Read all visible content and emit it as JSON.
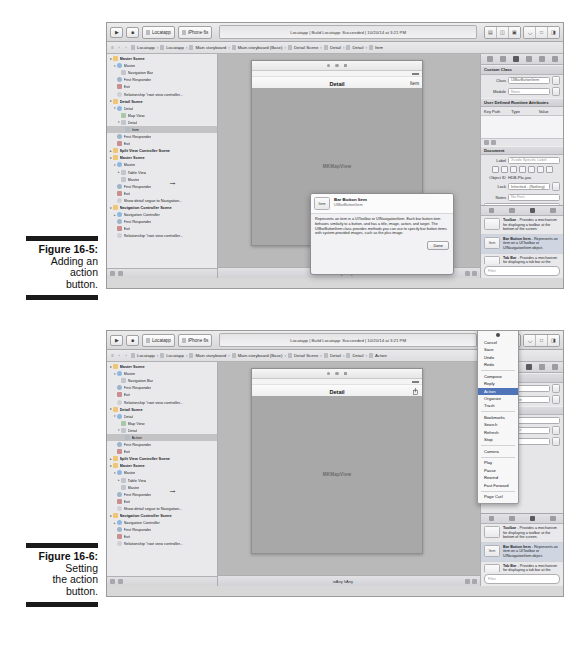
{
  "figures": [
    {
      "id": "fig-16-5",
      "number": "Figure 16-5:",
      "lines": [
        "Adding an",
        "action",
        "button."
      ]
    },
    {
      "id": "fig-16-6",
      "number": "Figure 16-6:",
      "lines": [
        "Setting",
        "the action",
        "button."
      ]
    }
  ],
  "xcode": {
    "toolbar": {
      "run_label": "▶",
      "stop_label": "■",
      "scheme_label": "Locatapp",
      "destination_label": "iPhone 6s",
      "status_text": "Locatapp | Build Locatapp: Succeeded | 10/20/14 at 3:21 PM",
      "editor_segments": [
        "▤",
        "▥",
        "▧"
      ],
      "view_segments": [
        "◧",
        "□",
        "◨"
      ]
    },
    "jumpbar": {
      "back_label": "‹",
      "forward_label": "›",
      "crumbs_5": [
        "Locatapp",
        "Locatapp",
        "Main.storyboard",
        "Main.storyboard (Base)",
        "Detail Scene",
        "Detail",
        "Detail",
        "Item"
      ],
      "crumbs_6": [
        "Locatapp",
        "Locatapp",
        "Main.storyboard",
        "Main.storyboard (Base)",
        "Detail Scene",
        "Detail",
        "Detail",
        "Action"
      ]
    },
    "canvas_title": "Main.storyboard",
    "outline_5": [
      {
        "label": "Master Scene",
        "depth": 0,
        "kind": "scene",
        "twisty": "▾",
        "selected": false
      },
      {
        "label": "Master",
        "depth": 1,
        "kind": "vc",
        "twisty": "▾",
        "selected": false
      },
      {
        "label": "Navigation Bar",
        "depth": 2,
        "kind": "bar",
        "twisty": "",
        "selected": false
      },
      {
        "label": "First Responder",
        "depth": 1,
        "kind": "resp",
        "twisty": "",
        "selected": false
      },
      {
        "label": "Exit",
        "depth": 1,
        "kind": "exit",
        "twisty": "",
        "selected": false
      },
      {
        "label": "Relationship \"root view controller...",
        "depth": 1,
        "kind": "rel",
        "twisty": "",
        "selected": false
      },
      {
        "label": "Detail Scene",
        "depth": 0,
        "kind": "scene",
        "twisty": "▾",
        "selected": false
      },
      {
        "label": "Detail",
        "depth": 1,
        "kind": "vc",
        "twisty": "▾",
        "selected": false
      },
      {
        "label": "Map View",
        "depth": 2,
        "kind": "map",
        "twisty": "",
        "selected": false
      },
      {
        "label": "Detail",
        "depth": 2,
        "kind": "bar",
        "twisty": "▾",
        "selected": false
      },
      {
        "label": "Item",
        "depth": 3,
        "kind": "item",
        "twisty": "",
        "selected": true
      },
      {
        "label": "First Responder",
        "depth": 1,
        "kind": "resp",
        "twisty": "",
        "selected": false
      },
      {
        "label": "Exit",
        "depth": 1,
        "kind": "exit",
        "twisty": "",
        "selected": false
      },
      {
        "label": "Split View Controller Scene",
        "depth": 0,
        "kind": "scene",
        "twisty": "▸",
        "selected": false
      },
      {
        "label": "Master Scene",
        "depth": 0,
        "kind": "scene",
        "twisty": "▾",
        "selected": false
      },
      {
        "label": "Master",
        "depth": 1,
        "kind": "vc",
        "twisty": "▾",
        "selected": false
      },
      {
        "label": "Table View",
        "depth": 2,
        "kind": "table",
        "twisty": "▸",
        "selected": false
      },
      {
        "label": "Master",
        "depth": 2,
        "kind": "bar",
        "twisty": "",
        "selected": false
      },
      {
        "label": "First Responder",
        "depth": 1,
        "kind": "resp",
        "twisty": "",
        "selected": false
      },
      {
        "label": "Exit",
        "depth": 1,
        "kind": "exit",
        "twisty": "",
        "selected": false
      },
      {
        "label": "Show detail segue to Navigation...",
        "depth": 1,
        "kind": "rel",
        "twisty": "",
        "selected": false
      },
      {
        "label": "Navigation Controller Scene",
        "depth": 0,
        "kind": "scene",
        "twisty": "▾",
        "selected": false
      },
      {
        "label": "Navigation Controller",
        "depth": 1,
        "kind": "vc",
        "twisty": "▸",
        "selected": false
      },
      {
        "label": "First Responder",
        "depth": 1,
        "kind": "resp",
        "twisty": "",
        "selected": false
      },
      {
        "label": "Exit",
        "depth": 1,
        "kind": "exit",
        "twisty": "",
        "selected": false
      },
      {
        "label": "Relationship \"root view controller...",
        "depth": 1,
        "kind": "rel",
        "twisty": "",
        "selected": false
      }
    ],
    "outline_6": [
      {
        "label": "Master Scene",
        "depth": 0,
        "kind": "scene",
        "twisty": "▾",
        "selected": false
      },
      {
        "label": "Master",
        "depth": 1,
        "kind": "vc",
        "twisty": "▾",
        "selected": false
      },
      {
        "label": "Navigation Bar",
        "depth": 2,
        "kind": "bar",
        "twisty": "",
        "selected": false
      },
      {
        "label": "First Responder",
        "depth": 1,
        "kind": "resp",
        "twisty": "",
        "selected": false
      },
      {
        "label": "Exit",
        "depth": 1,
        "kind": "exit",
        "twisty": "",
        "selected": false
      },
      {
        "label": "Relationship \"root view controller...",
        "depth": 1,
        "kind": "rel",
        "twisty": "",
        "selected": false
      },
      {
        "label": "Detail Scene",
        "depth": 0,
        "kind": "scene",
        "twisty": "▾",
        "selected": false
      },
      {
        "label": "Detail",
        "depth": 1,
        "kind": "vc",
        "twisty": "▾",
        "selected": false
      },
      {
        "label": "Map View",
        "depth": 2,
        "kind": "map",
        "twisty": "",
        "selected": false
      },
      {
        "label": "Detail",
        "depth": 2,
        "kind": "bar",
        "twisty": "▾",
        "selected": false
      },
      {
        "label": "Action",
        "depth": 3,
        "kind": "item",
        "twisty": "",
        "selected": true
      },
      {
        "label": "First Responder",
        "depth": 1,
        "kind": "resp",
        "twisty": "",
        "selected": false
      },
      {
        "label": "Exit",
        "depth": 1,
        "kind": "exit",
        "twisty": "",
        "selected": false
      },
      {
        "label": "Split View Controller Scene",
        "depth": 0,
        "kind": "scene",
        "twisty": "▸",
        "selected": false
      },
      {
        "label": "Master Scene",
        "depth": 0,
        "kind": "scene",
        "twisty": "▾",
        "selected": false
      },
      {
        "label": "Master",
        "depth": 1,
        "kind": "vc",
        "twisty": "▾",
        "selected": false
      },
      {
        "label": "Table View",
        "depth": 2,
        "kind": "table",
        "twisty": "▸",
        "selected": false
      },
      {
        "label": "Master",
        "depth": 2,
        "kind": "bar",
        "twisty": "",
        "selected": false
      },
      {
        "label": "First Responder",
        "depth": 1,
        "kind": "resp",
        "twisty": "",
        "selected": false
      },
      {
        "label": "Exit",
        "depth": 1,
        "kind": "exit",
        "twisty": "",
        "selected": false
      },
      {
        "label": "Show detail segue to Navigation...",
        "depth": 1,
        "kind": "rel",
        "twisty": "",
        "selected": false
      },
      {
        "label": "Navigation Controller Scene",
        "depth": 0,
        "kind": "scene",
        "twisty": "▾",
        "selected": false
      },
      {
        "label": "Navigation Controller",
        "depth": 1,
        "kind": "vc",
        "twisty": "▸",
        "selected": false
      },
      {
        "label": "First Responder",
        "depth": 1,
        "kind": "resp",
        "twisty": "",
        "selected": false
      },
      {
        "label": "Exit",
        "depth": 1,
        "kind": "exit",
        "twisty": "",
        "selected": false
      },
      {
        "label": "Relationship \"root view controller...",
        "depth": 1,
        "kind": "rel",
        "twisty": "",
        "selected": false
      }
    ],
    "device": {
      "nav_title": "Detail",
      "right_button_5": "Item",
      "right_button_6": "",
      "map_placeholder": "MKMapView"
    },
    "canvas_foot": {
      "size_class_5": "wAny hAny",
      "size_class_6": "wAny hAny",
      "zoom_label": "100%"
    },
    "inspector": {
      "sections": {
        "custom_class": "Custom Class",
        "runtime_attrs": "User Defined Runtime Attributes",
        "document": "Document"
      },
      "class_label": "Class",
      "class_value": "UIBarButtonItem",
      "module_label": "Module",
      "module_value": "None",
      "attr_columns": [
        "Key Path",
        "Type",
        "Value"
      ],
      "label_label": "Label",
      "label_value": "Xcode Specific Label",
      "object_id_label": "Object ID",
      "object_id_value": "HDB-Pla-yas",
      "lock_label": "Lock",
      "lock_value": "Inherited - (Nothing)",
      "notes_label": "Notes",
      "notes_placeholder": "No Font"
    },
    "library": {
      "items": [
        {
          "thumb": "",
          "title": "Toolbar",
          "desc": " - Provides a mechanism for displaying a toolbar at the bottom of the screen.",
          "highlight": false
        },
        {
          "thumb": "Item",
          "title": "Bar Button Item",
          "desc": " - Represents an item on a UIToolbar or UINavigationItem object.",
          "highlight": true
        },
        {
          "thumb": "",
          "title": "Tab Bar",
          "desc": " - Provides a mechanism for displaying a tab bar at the bottom of the screen.",
          "highlight": false
        }
      ],
      "search_placeholder": "Filter"
    },
    "quick_help": {
      "thumb": "Item",
      "title": "Bar Button Item",
      "subtitle": "UIBarButtonItem",
      "body": "Represents an item in a UIToolbar or UINavigationItem. Each bar button item behaves similarly to a button, and has a title, image, action, and target. The UIBarButtonItem class provides methods you can use to specify bar button items with system-provided images, such as the plus image.",
      "done_label": "Done"
    },
    "context_menu": {
      "groups": [
        [
          "Cancel",
          "Save",
          "Undo",
          "Redo"
        ],
        [
          "Compose",
          "Reply",
          "Action",
          "Organize",
          "Trash"
        ],
        [
          "Bookmarks",
          "Search",
          "Refresh",
          "Stop"
        ],
        [
          "Camera"
        ],
        [
          "Play",
          "Pause",
          "Rewind",
          "Fast Forward"
        ],
        [
          "Page Curl"
        ]
      ],
      "selected": "Action"
    }
  }
}
